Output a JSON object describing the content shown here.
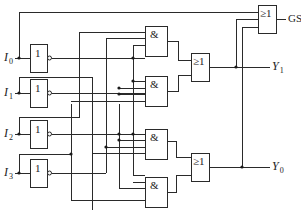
{
  "diagram": {
    "inputs": [
      {
        "name": "I",
        "sub": "0"
      },
      {
        "name": "I",
        "sub": "1"
      },
      {
        "name": "I",
        "sub": "2"
      },
      {
        "name": "I",
        "sub": "3"
      }
    ],
    "outputs": [
      {
        "name": "GS",
        "sub": ""
      },
      {
        "name": "Y",
        "sub": "1"
      },
      {
        "name": "Y",
        "sub": "0"
      }
    ],
    "gates": {
      "not_symbol": "1",
      "and_symbol": "&",
      "or_symbol": "≥1"
    },
    "colors": {
      "line": "#2a2a2a",
      "background": "#ffffff"
    }
  }
}
